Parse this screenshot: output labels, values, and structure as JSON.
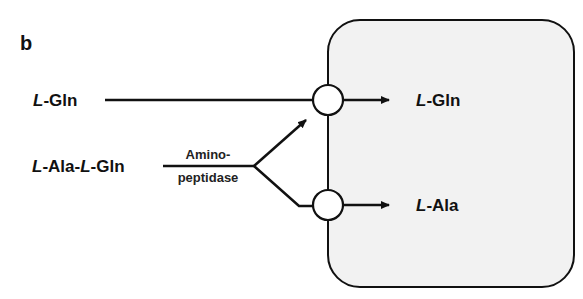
{
  "panel_label": "b",
  "inputs": {
    "gln": {
      "prefix": "L",
      "name": "-Gln"
    },
    "dipeptide": {
      "p1": "L",
      "n1": "-Ala-",
      "p2": "L",
      "n2": "-Gln"
    }
  },
  "enzyme": {
    "line1": "Amino-",
    "line2": "peptidase"
  },
  "outputs": {
    "gln": {
      "prefix": "L",
      "name": "-Gln"
    },
    "ala": {
      "prefix": "L",
      "name": "-Ala"
    }
  },
  "colors": {
    "cell_fill": "#f2f2f2",
    "stroke": "#111111"
  }
}
